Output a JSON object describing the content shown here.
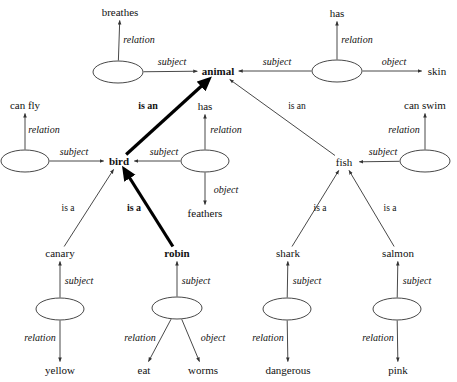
{
  "diagram": {
    "stroke_color": "#333333",
    "bold_stroke_color": "#000000",
    "text_color": "#111111",
    "background": "#ffffff",
    "concept_nodes": [
      {
        "id": "breathes",
        "label": "breathes",
        "x": 120,
        "y": 12,
        "bold": false
      },
      {
        "id": "has_top",
        "label": "has",
        "x": 337,
        "y": 13,
        "bold": false
      },
      {
        "id": "animal",
        "label": "animal",
        "x": 218,
        "y": 71,
        "bold": true
      },
      {
        "id": "skin",
        "label": "skin",
        "x": 437,
        "y": 71,
        "bold": false
      },
      {
        "id": "canfly",
        "label": "can fly",
        "x": 25,
        "y": 105,
        "bold": false
      },
      {
        "id": "has_mid",
        "label": "has",
        "x": 205,
        "y": 106,
        "bold": false
      },
      {
        "id": "canswim",
        "label": "can swim",
        "x": 425,
        "y": 105,
        "bold": false
      },
      {
        "id": "bird",
        "label": "bird",
        "x": 119,
        "y": 161,
        "bold": true
      },
      {
        "id": "fish",
        "label": "fish",
        "x": 344,
        "y": 162,
        "bold": false
      },
      {
        "id": "feathers",
        "label": "feathers",
        "x": 205,
        "y": 213,
        "bold": false
      },
      {
        "id": "canary",
        "label": "canary",
        "x": 60,
        "y": 253,
        "bold": false
      },
      {
        "id": "robin",
        "label": "robin",
        "x": 177,
        "y": 253,
        "bold": true
      },
      {
        "id": "shark",
        "label": "shark",
        "x": 288,
        "y": 253,
        "bold": false
      },
      {
        "id": "salmon",
        "label": "salmon",
        "x": 398,
        "y": 253,
        "bold": false
      },
      {
        "id": "yellow",
        "label": "yellow",
        "x": 60,
        "y": 370,
        "bold": false
      },
      {
        "id": "eat",
        "label": "eat",
        "x": 144,
        "y": 370,
        "bold": false
      },
      {
        "id": "worms",
        "label": "worms",
        "x": 203,
        "y": 370,
        "bold": false
      },
      {
        "id": "dangerous",
        "label": "dangerous",
        "x": 288,
        "y": 370,
        "bold": false
      },
      {
        "id": "pink",
        "label": "pink",
        "x": 398,
        "y": 370,
        "bold": false
      }
    ],
    "relation_nodes": [
      {
        "id": "rel-breathes",
        "x": 118,
        "y": 72,
        "rx": 25,
        "ry": 11
      },
      {
        "id": "rel-hasskin",
        "x": 337,
        "y": 71,
        "rx": 25,
        "ry": 11
      },
      {
        "id": "rel-canfly",
        "x": 25,
        "y": 161,
        "rx": 24,
        "ry": 11
      },
      {
        "id": "rel-feathers",
        "x": 205,
        "y": 161,
        "rx": 24,
        "ry": 11
      },
      {
        "id": "rel-canswim",
        "x": 425,
        "y": 161,
        "rx": 25,
        "ry": 11
      },
      {
        "id": "rel-yellow",
        "x": 60,
        "y": 309,
        "rx": 24,
        "ry": 11
      },
      {
        "id": "rel-worms",
        "x": 177,
        "y": 308,
        "rx": 25,
        "ry": 11
      },
      {
        "id": "rel-danger",
        "x": 287,
        "y": 309,
        "rx": 24,
        "ry": 11
      },
      {
        "id": "rel-pink",
        "x": 397,
        "y": 309,
        "rx": 24,
        "ry": 11
      }
    ],
    "edge_labels": [
      {
        "id": "lbl-relation-breathes",
        "text": "relation",
        "x": 139,
        "y": 40,
        "style": "italic"
      },
      {
        "id": "lbl-subject-breathes",
        "text": "subject",
        "x": 172,
        "y": 62,
        "style": "italic"
      },
      {
        "id": "lbl-relation-hasskin",
        "text": "relation",
        "x": 357,
        "y": 40,
        "style": "italic"
      },
      {
        "id": "lbl-subject-hasskin",
        "text": "subject",
        "x": 277,
        "y": 62,
        "style": "italic"
      },
      {
        "id": "lbl-object-skin",
        "text": "object",
        "x": 394,
        "y": 62,
        "style": "italic"
      },
      {
        "id": "lbl-isan-bird",
        "text": "is an",
        "x": 148,
        "y": 106,
        "style": "bold"
      },
      {
        "id": "lbl-isan-fish",
        "text": "is an",
        "x": 297,
        "y": 106,
        "style": "plain"
      },
      {
        "id": "lbl-relation-canfly",
        "text": "relation",
        "x": 44,
        "y": 130,
        "style": "italic"
      },
      {
        "id": "lbl-subject-canfly",
        "text": "subject",
        "x": 74,
        "y": 152,
        "style": "italic"
      },
      {
        "id": "lbl-relation-feathers",
        "text": "relation",
        "x": 226,
        "y": 130,
        "style": "italic"
      },
      {
        "id": "lbl-subject-feathers",
        "text": "subject",
        "x": 164,
        "y": 152,
        "style": "italic"
      },
      {
        "id": "lbl-object-feathers",
        "text": "object",
        "x": 226,
        "y": 190,
        "style": "italic"
      },
      {
        "id": "lbl-relation-canswim",
        "text": "relation",
        "x": 404,
        "y": 130,
        "style": "italic"
      },
      {
        "id": "lbl-subject-canswim",
        "text": "subject",
        "x": 383,
        "y": 152,
        "style": "italic"
      },
      {
        "id": "lbl-isa-canary",
        "text": "is a",
        "x": 68,
        "y": 208,
        "style": "plain"
      },
      {
        "id": "lbl-isa-robin",
        "text": "is a",
        "x": 134,
        "y": 208,
        "style": "bold"
      },
      {
        "id": "lbl-isa-shark",
        "text": "is a",
        "x": 320,
        "y": 208,
        "style": "plain"
      },
      {
        "id": "lbl-isa-salmon",
        "text": "is a",
        "x": 390,
        "y": 208,
        "style": "plain"
      },
      {
        "id": "lbl-subject-canary",
        "text": "subject",
        "x": 79,
        "y": 281,
        "style": "italic"
      },
      {
        "id": "lbl-subject-robin",
        "text": "subject",
        "x": 196,
        "y": 281,
        "style": "italic"
      },
      {
        "id": "lbl-subject-shark",
        "text": "subject",
        "x": 307,
        "y": 281,
        "style": "italic"
      },
      {
        "id": "lbl-subject-salmon",
        "text": "subject",
        "x": 417,
        "y": 281,
        "style": "italic"
      },
      {
        "id": "lbl-relation-yellow",
        "text": "relation",
        "x": 40,
        "y": 338,
        "style": "italic"
      },
      {
        "id": "lbl-relation-eat",
        "text": "relation",
        "x": 140,
        "y": 338,
        "style": "italic"
      },
      {
        "id": "lbl-object-worms",
        "text": "object",
        "x": 213,
        "y": 338,
        "style": "italic"
      },
      {
        "id": "lbl-relation-danger",
        "text": "relation",
        "x": 268,
        "y": 338,
        "style": "italic"
      },
      {
        "id": "lbl-relation-pink",
        "text": "relation",
        "x": 378,
        "y": 338,
        "style": "italic"
      }
    ],
    "edges": [
      {
        "id": "edge-rel-breathes",
        "from": "rel-breathes",
        "to": "breathes",
        "bold": false,
        "arrow": true
      },
      {
        "id": "edge-breathes-animal",
        "from": "rel-breathes",
        "to": "animal",
        "bold": false,
        "arrow": true
      },
      {
        "id": "edge-rel-hasskin",
        "from": "rel-hasskin",
        "to": "has_top",
        "bold": false,
        "arrow": true
      },
      {
        "id": "edge-hasskin-animal",
        "from": "rel-hasskin",
        "to": "animal",
        "bold": false,
        "arrow": true
      },
      {
        "id": "edge-hasskin-skin",
        "from": "rel-hasskin",
        "to": "skin",
        "bold": false,
        "arrow": true
      },
      {
        "id": "edge-bird-animal",
        "from": "bird",
        "to": "animal",
        "bold": true,
        "arrow": true
      },
      {
        "id": "edge-fish-animal",
        "from": "fish",
        "to": "animal",
        "bold": false,
        "arrow": true
      },
      {
        "id": "edge-rel-canfly",
        "from": "rel-canfly",
        "to": "canfly",
        "bold": false,
        "arrow": true
      },
      {
        "id": "edge-canfly-bird",
        "from": "rel-canfly",
        "to": "bird",
        "bold": false,
        "arrow": true
      },
      {
        "id": "edge-rel-hasmid",
        "from": "rel-feathers",
        "to": "has_mid",
        "bold": false,
        "arrow": true
      },
      {
        "id": "edge-feath-bird",
        "from": "rel-feathers",
        "to": "bird",
        "bold": false,
        "arrow": true
      },
      {
        "id": "edge-feath-feathers",
        "from": "rel-feathers",
        "to": "feathers",
        "bold": false,
        "arrow": true
      },
      {
        "id": "edge-rel-canswim",
        "from": "rel-canswim",
        "to": "canswim",
        "bold": false,
        "arrow": true
      },
      {
        "id": "edge-canswim-fish",
        "from": "rel-canswim",
        "to": "fish",
        "bold": false,
        "arrow": true
      },
      {
        "id": "edge-canary-bird",
        "from": "canary",
        "to": "bird",
        "bold": false,
        "arrow": true
      },
      {
        "id": "edge-robin-bird",
        "from": "robin",
        "to": "bird",
        "bold": true,
        "arrow": true
      },
      {
        "id": "edge-shark-fish",
        "from": "shark",
        "to": "fish",
        "bold": false,
        "arrow": true
      },
      {
        "id": "edge-salmon-fish",
        "from": "salmon",
        "to": "fish",
        "bold": false,
        "arrow": true
      },
      {
        "id": "edge-relyellow-canary",
        "from": "rel-yellow",
        "to": "canary",
        "bold": false,
        "arrow": true
      },
      {
        "id": "edge-relyellow-yellow",
        "from": "rel-yellow",
        "to": "yellow",
        "bold": false,
        "arrow": true
      },
      {
        "id": "edge-relworms-robin",
        "from": "rel-worms",
        "to": "robin",
        "bold": false,
        "arrow": true
      },
      {
        "id": "edge-relworms-eat",
        "from": "rel-worms",
        "to": "eat",
        "bold": false,
        "arrow": true
      },
      {
        "id": "edge-relworms-worms",
        "from": "rel-worms",
        "to": "worms",
        "bold": false,
        "arrow": true
      },
      {
        "id": "edge-reldanger-shark",
        "from": "rel-danger",
        "to": "shark",
        "bold": false,
        "arrow": true
      },
      {
        "id": "edge-reldanger-dang",
        "from": "rel-danger",
        "to": "dangerous",
        "bold": false,
        "arrow": true
      },
      {
        "id": "edge-relpink-salmon",
        "from": "rel-pink",
        "to": "salmon",
        "bold": false,
        "arrow": true
      },
      {
        "id": "edge-relpink-pink",
        "from": "rel-pink",
        "to": "pink",
        "bold": false,
        "arrow": true
      }
    ]
  }
}
